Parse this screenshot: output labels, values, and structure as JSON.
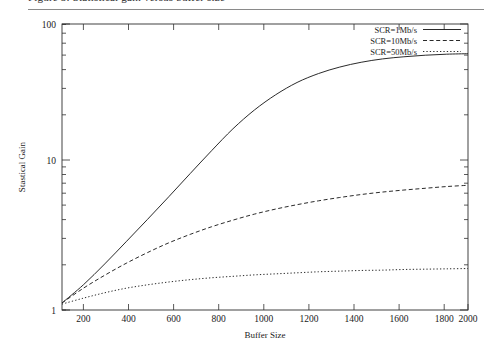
{
  "page": {
    "cutoff_caption": "Figure 5: Statistical gain versus buffer size"
  },
  "chart_data": {
    "type": "line",
    "title": "",
    "xlabel": "Buffer Size",
    "ylabel": "Stastical Gain",
    "xlim": [
      100,
      2000
    ],
    "ylim": [
      1,
      100
    ],
    "yscale": "log",
    "grid": false,
    "legend_position": "top-right",
    "xticks": [
      200,
      400,
      600,
      800,
      1000,
      1200,
      1400,
      1600,
      1800,
      2000
    ],
    "yticks": [
      1,
      10,
      100
    ],
    "x": [
      100,
      200,
      300,
      400,
      500,
      600,
      700,
      800,
      900,
      1000,
      1100,
      1200,
      1300,
      1400,
      1500,
      1600,
      1700,
      1800,
      1900,
      2000
    ],
    "series": [
      {
        "name": "SCR=1Mb/s",
        "style": "solid",
        "values": [
          1.12,
          1.5,
          2.1,
          3.0,
          4.3,
          6.2,
          9.0,
          13.0,
          18.5,
          25.0,
          32.0,
          39.0,
          45.0,
          50.0,
          54.0,
          57.0,
          59.0,
          60.5,
          61.5,
          62.0
        ]
      },
      {
        "name": "SCR=10Mb/s",
        "style": "dashed",
        "values": [
          1.12,
          1.42,
          1.75,
          2.12,
          2.52,
          2.95,
          3.38,
          3.82,
          4.25,
          4.68,
          5.08,
          5.45,
          5.8,
          6.12,
          6.42,
          6.68,
          6.9,
          7.1,
          7.3,
          7.45
        ]
      },
      {
        "name": "SCR=50Mb/s",
        "style": "dotted",
        "values": [
          1.1,
          1.21,
          1.32,
          1.42,
          1.5,
          1.57,
          1.63,
          1.68,
          1.72,
          1.76,
          1.79,
          1.82,
          1.85,
          1.87,
          1.89,
          1.9,
          1.92,
          1.93,
          1.94,
          1.95
        ]
      }
    ]
  },
  "legend": {
    "entries": [
      {
        "label": "SCR=1Mb/s"
      },
      {
        "label": "SCR=10Mb/s"
      },
      {
        "label": "SCR=50Mb/s"
      }
    ]
  },
  "axes": {
    "x_tick_labels": [
      "200",
      "400",
      "600",
      "800",
      "1000",
      "1200",
      "1400",
      "1600",
      "1800",
      "2000"
    ],
    "y_tick_labels": [
      "1",
      "10",
      "100"
    ],
    "x_title": "Buffer Size",
    "y_title": "Stastical Gain"
  }
}
